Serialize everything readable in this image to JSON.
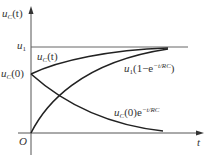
{
  "diagram": {
    "type": "RC circuit capacitor voltage response curves",
    "axes": {
      "y_label": {
        "base": "u",
        "sub": "C",
        "arg": "(t)"
      },
      "x_label": "t",
      "origin_label": "O"
    },
    "levels": {
      "u1": {
        "base": "u",
        "sub": "1"
      },
      "uc0": {
        "base": "u",
        "sub": "C",
        "arg": "(0)"
      }
    },
    "curves": [
      {
        "name": "total-response",
        "label": {
          "base": "u",
          "sub": "C",
          "arg": "(t)"
        }
      },
      {
        "name": "zero-state-response",
        "label": {
          "base": "u",
          "sub": "1",
          "pre": "(1−e",
          "exp": "−t/RC",
          "post": ")"
        }
      },
      {
        "name": "zero-input-response",
        "label": {
          "base": "u",
          "sub": "C",
          "pre": "(0)e",
          "exp": "−t/RC"
        }
      }
    ],
    "colors": {
      "stroke": "#222222",
      "text": "#333333",
      "axis": "#555555"
    }
  }
}
